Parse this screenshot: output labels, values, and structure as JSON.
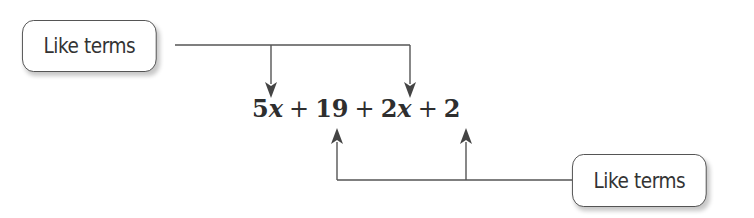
{
  "diagram": {
    "title": "",
    "labels": {
      "top_left": "Like terms",
      "bottom_right": "Like terms"
    },
    "expression": {
      "terms": [
        {
          "coef": "5",
          "var": "x"
        },
        {
          "op": "+"
        },
        {
          "coef": "19",
          "var": ""
        },
        {
          "op": "+"
        },
        {
          "coef": "2",
          "var": "x"
        },
        {
          "op": "+"
        },
        {
          "coef": "2",
          "var": ""
        }
      ],
      "full_text": "5x + 19 + 2x + 2"
    },
    "groups": [
      {
        "label": "Like terms",
        "points_to": [
          "5x",
          "2x"
        ],
        "direction": "down"
      },
      {
        "label": "Like terms",
        "points_to": [
          "19",
          "2"
        ],
        "direction": "up"
      }
    ],
    "colors": {
      "line": "#555555",
      "text": "#333333",
      "box_border": "#4a4a4a"
    }
  }
}
